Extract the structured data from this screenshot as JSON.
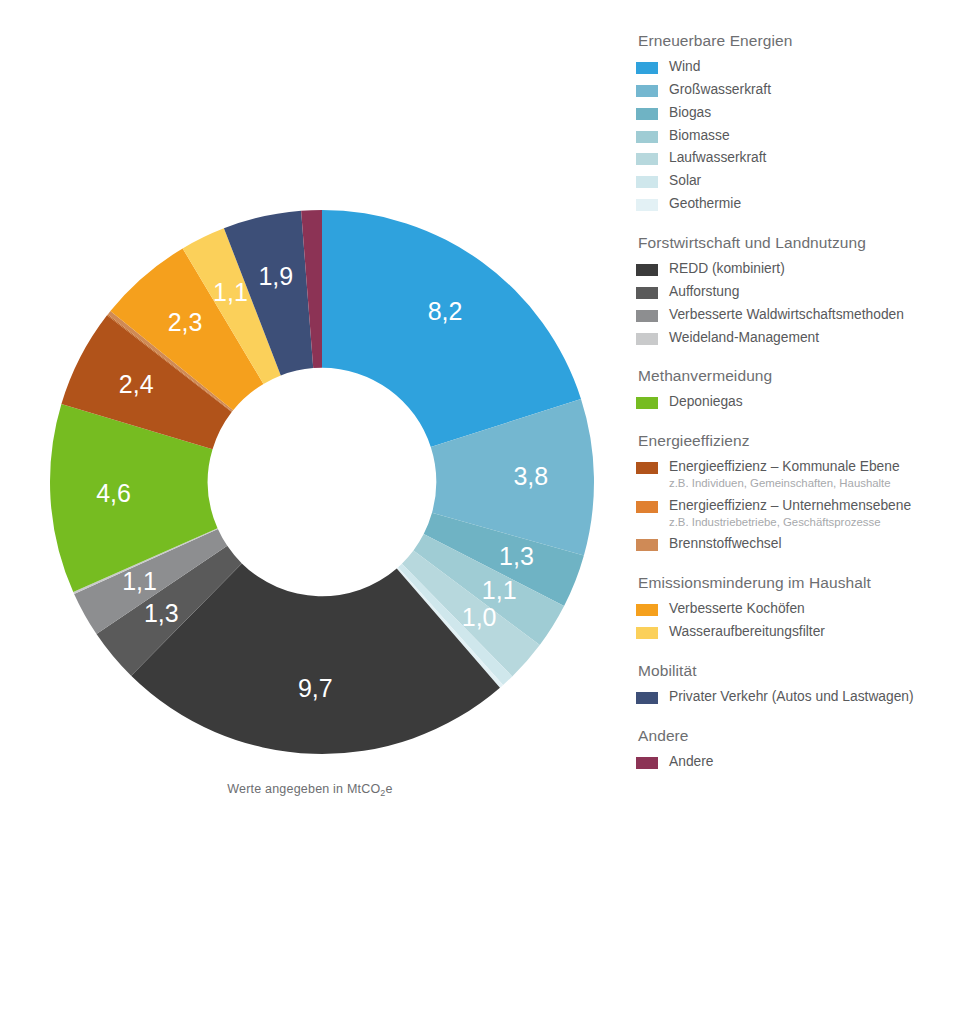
{
  "caption": {
    "prefix": "Werte angegeben in MtCO",
    "sub": "2",
    "suffix": "e"
  },
  "chart_data": {
    "type": "pie",
    "variant": "donut",
    "title": "",
    "unit": "MtCO2e",
    "start_angle_deg": 0,
    "direction": "clockwise",
    "inner_radius_ratio": 0.42,
    "categories": [
      "Wind",
      "Großwasserkraft",
      "Biogas",
      "Biomasse",
      "Laufwasserkraft",
      "Solar",
      "Geothermie",
      "REDD (kombiniert)",
      "Aufforstung",
      "Verbesserte Waldwirtschaftsmethoden",
      "Weideland-Management",
      "Deponiegas",
      "Energieeffizienz – Kommunale Ebene",
      "Energieeffizienz – Unternehmensebene",
      "Brennstoffwechsel",
      "Verbesserte Kochöfen",
      "Wasseraufbereitungsfilter",
      "Privater Verkehr (Autos und Lastwagen)",
      "Andere"
    ],
    "values": [
      8.2,
      3.8,
      1.3,
      1.1,
      1.0,
      0.3,
      0.1,
      9.7,
      1.3,
      1.1,
      0.05,
      4.6,
      2.4,
      0.03,
      0.1,
      2.3,
      1.1,
      1.9,
      0.5
    ],
    "labels": [
      "8,2",
      "3,8",
      "1,3",
      "1,1",
      "1,0",
      "0,3",
      "0,1",
      "9,7",
      "1,3",
      "1,1",
      "0,05",
      "4,6",
      "2,4",
      "0,03",
      "0,1",
      "2,3",
      "1,1",
      "1,9",
      "0,5"
    ],
    "colors": [
      "#2fa2dd",
      "#74b7d0",
      "#6fb3c4",
      "#9fccd4",
      "#b7d8dd",
      "#cfe7ec",
      "#e3f1f5",
      "#3b3b3b",
      "#5a5a5a",
      "#8d8e90",
      "#c9cacb",
      "#76bc21",
      "#b1531a",
      "#c1641f",
      "#cf8a56",
      "#f5a01d",
      "#fbd05a",
      "#3d4f78",
      "#8c3355"
    ],
    "label_positions": [
      "inside",
      "inside",
      "inside",
      "inside",
      "inside",
      "outside",
      "outside",
      "inside",
      "inside",
      "inside",
      "outside",
      "inside",
      "inside",
      "outside",
      "outside",
      "inside",
      "inside",
      "inside",
      "outside"
    ],
    "legend_position": "right"
  },
  "legend": {
    "groups": [
      {
        "title": "Erneuerbare Energien",
        "items": [
          {
            "label": "Wind",
            "sub": "",
            "color": "#2fa2dd"
          },
          {
            "label": "Großwasserkraft",
            "sub": "",
            "color": "#74b7d0"
          },
          {
            "label": "Biogas",
            "sub": "",
            "color": "#6fb3c4"
          },
          {
            "label": "Biomasse",
            "sub": "",
            "color": "#9fccd4"
          },
          {
            "label": "Laufwasserkraft",
            "sub": "",
            "color": "#b7d8dd"
          },
          {
            "label": "Solar",
            "sub": "",
            "color": "#cfe7ec"
          },
          {
            "label": "Geothermie",
            "sub": "",
            "color": "#e3f1f5"
          }
        ]
      },
      {
        "title": "Forstwirtschaft und Landnutzung",
        "items": [
          {
            "label": "REDD (kombiniert)",
            "sub": "",
            "color": "#3b3b3b"
          },
          {
            "label": "Aufforstung",
            "sub": "",
            "color": "#5a5a5a"
          },
          {
            "label": "Verbesserte Waldwirtschaftsmethoden",
            "sub": "",
            "color": "#8d8e90"
          },
          {
            "label": "Weideland-Management",
            "sub": "",
            "color": "#c9cacb"
          }
        ]
      },
      {
        "title": "Methanvermeidung",
        "items": [
          {
            "label": "Deponiegas",
            "sub": "",
            "color": "#76bc21"
          }
        ]
      },
      {
        "title": "Energieeffizienz",
        "items": [
          {
            "label": "Energieeffizienz – Kommunale Ebene",
            "sub": "z.B. Individuen, Gemeinschaften, Haushalte",
            "color": "#b1531a"
          },
          {
            "label": "Energieeffizienz – Unternehmensebene",
            "sub": "z.B. Industriebetriebe, Geschäftsprozesse",
            "color": "#e08030"
          },
          {
            "label": "Brennstoffwechsel",
            "sub": "",
            "color": "#cf8a56"
          }
        ]
      },
      {
        "title": "Emissionsminderung im Haushalt",
        "items": [
          {
            "label": "Verbesserte Kochöfen",
            "sub": "",
            "color": "#f5a01d"
          },
          {
            "label": "Wasseraufbereitungsfilter",
            "sub": "",
            "color": "#fbd05a"
          }
        ]
      },
      {
        "title": "Mobilität",
        "items": [
          {
            "label": "Privater Verkehr (Autos und Lastwagen)",
            "sub": "",
            "color": "#3d4f78"
          }
        ]
      },
      {
        "title": "Andere",
        "items": [
          {
            "label": "Andere",
            "sub": "",
            "color": "#8c3355"
          }
        ]
      }
    ]
  }
}
